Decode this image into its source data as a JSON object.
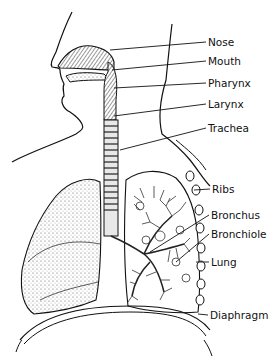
{
  "diagram": {
    "labels": [
      {
        "id": "nose",
        "text": "Nose",
        "x": 208,
        "y": 36
      },
      {
        "id": "mouth",
        "text": "Mouth",
        "x": 208,
        "y": 55
      },
      {
        "id": "pharynx",
        "text": "Pharynx",
        "x": 208,
        "y": 77
      },
      {
        "id": "larynx",
        "text": "Larynx",
        "x": 208,
        "y": 98
      },
      {
        "id": "trachea",
        "text": "Trachea",
        "x": 208,
        "y": 122
      },
      {
        "id": "ribs",
        "text": "Ribs",
        "x": 212,
        "y": 183
      },
      {
        "id": "bronchus",
        "text": "Bronchus",
        "x": 211,
        "y": 209
      },
      {
        "id": "bronchiole",
        "text": "Bronchiole",
        "x": 211,
        "y": 228
      },
      {
        "id": "lung",
        "text": "Lung",
        "x": 211,
        "y": 256
      },
      {
        "id": "diaphragm",
        "text": "Diaphragm",
        "x": 210,
        "y": 309
      }
    ],
    "colors": {
      "line": "#111111",
      "background": "#ffffff",
      "stipple": "#555555"
    }
  }
}
